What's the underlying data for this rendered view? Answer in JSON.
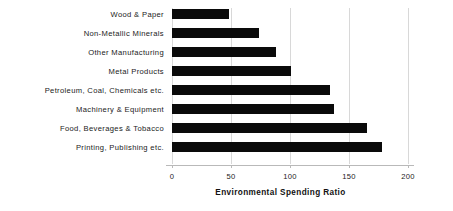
{
  "chart_data": {
    "type": "bar",
    "orientation": "horizontal",
    "title": "",
    "xlabel": "Environmental Spending Ratio",
    "ylabel": "",
    "categories": [
      "Wood & Paper",
      "Non-Metallic Minerals",
      "Other Manufacturing",
      "Metal Products",
      "Petroleum, Coal, Chemicals etc.",
      "Machinery & Equipment",
      "Food, Beverages & Tobacco",
      "Printing, Publishing etc."
    ],
    "values": [
      48,
      74,
      88,
      101,
      134,
      137,
      165,
      178
    ],
    "xlim": [
      0,
      200
    ],
    "xticks": [
      0,
      50,
      100,
      150,
      200
    ],
    "xtick_labels": [
      "0",
      "50",
      "100",
      "150",
      "200"
    ],
    "grid": true,
    "grid_axis": "x",
    "legend": null,
    "bar_color": "#0a0a0a",
    "background_color": "#ffffff",
    "gridline_color": "#d8d8d8",
    "axis_color": "#b9b9b9"
  }
}
